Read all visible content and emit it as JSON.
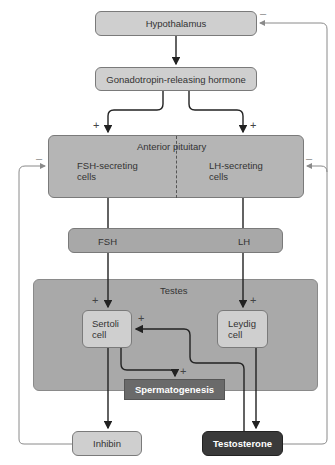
{
  "diagram": {
    "nodes": {
      "hypothalamus": "Hypothalamus",
      "gnrh": "Gonadotropin-releasing hormone",
      "anterior_pituitary": "Anterior pituitary",
      "fsh_cells": "FSH-secreting cells",
      "lh_cells": "LH-secreting cells",
      "fsh": "FSH",
      "lh": "LH",
      "testes": "Testes",
      "sertoli": "Sertoli cell",
      "leydig": "Leydig cell",
      "spermatogenesis": "Spermatogenesis",
      "inhibin": "Inhibin",
      "testosterone": "Testosterone"
    },
    "signs": {
      "plus": "+",
      "minus": "–"
    },
    "colors": {
      "light_box": "#cfcfcf",
      "mid_box": "#b5b5b5",
      "testes_bg": "#a9a9a9",
      "spermatogenesis_bg": "#6a6a6a",
      "testosterone_bg": "#3a3a3a",
      "feedback_line": "#8a8a8a",
      "main_line": "#222222"
    },
    "edges": [
      {
        "from": "Hypothalamus",
        "to": "Gonadotropin-releasing hormone"
      },
      {
        "from": "Gonadotropin-releasing hormone",
        "to": "FSH-secreting cells",
        "sign": "+"
      },
      {
        "from": "Gonadotropin-releasing hormone",
        "to": "LH-secreting cells",
        "sign": "+"
      },
      {
        "from": "FSH-secreting cells",
        "to": "Sertoli cell",
        "via": "FSH",
        "sign": "+"
      },
      {
        "from": "LH-secreting cells",
        "to": "Leydig cell",
        "via": "LH",
        "sign": "+"
      },
      {
        "from": "Sertoli cell",
        "to": "Spermatogenesis",
        "sign": "+"
      },
      {
        "from": "Sertoli cell",
        "to": "Inhibin"
      },
      {
        "from": "Leydig cell",
        "to": "Testosterone"
      },
      {
        "from": "Testosterone",
        "to": "Sertoli cell",
        "sign": "+"
      },
      {
        "from": "Inhibin",
        "to": "Anterior pituitary (FSH)",
        "sign": "–"
      },
      {
        "from": "Testosterone",
        "to": "Anterior pituitary (LH)",
        "sign": "–"
      },
      {
        "from": "Testosterone",
        "to": "Hypothalamus",
        "sign": "–"
      }
    ]
  }
}
